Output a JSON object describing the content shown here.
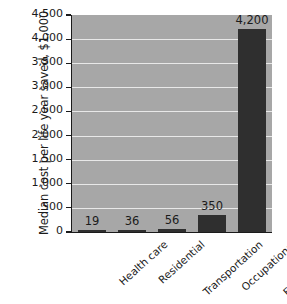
{
  "chart_data": {
    "type": "bar",
    "title": "",
    "xlabel": "",
    "ylabel": "Median cost per life year saved, $1,000",
    "categories": [
      "Health care",
      "Residential",
      "Transportation",
      "Occupational",
      "Environmental"
    ],
    "values": [
      19,
      36,
      56,
      350,
      4200
    ],
    "value_labels": [
      "19",
      "36",
      "56",
      "350",
      "4,200"
    ],
    "ylim": [
      0,
      4500
    ],
    "ytick_values": [
      0,
      500,
      1000,
      1500,
      2000,
      2500,
      3000,
      3500,
      4000,
      4500
    ],
    "ytick_labels": [
      "0",
      "500",
      "1,000",
      "1,500",
      "2,000",
      "2,500",
      "3,000",
      "3,500",
      "4,000",
      "4,500"
    ],
    "grid": true,
    "legend": "none",
    "colors": {
      "bar": "#2f2f2f",
      "plot_background": "#a7a7a7",
      "gridline": "#e8e8e8",
      "axis": "#1b1b1b",
      "text": "#1b1b1b",
      "page_background": "#ffffff"
    }
  }
}
